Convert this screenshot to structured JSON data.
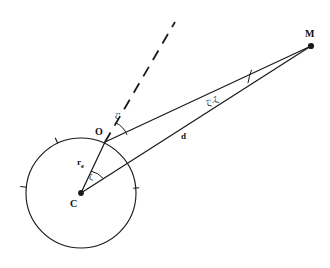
{
  "figure": {
    "background_color": "#ffffff",
    "stroke_color": "#1a1a1a",
    "width": 330,
    "height": 268
  },
  "points": [
    {
      "id": "C",
      "label": "C",
      "role": "sphere-center",
      "x": 81,
      "y": 193,
      "marker": "filled-dot",
      "label_x": 70,
      "label_y": 199
    },
    {
      "id": "O",
      "label": "O",
      "role": "observer-on-surface",
      "x": 105,
      "y": 142,
      "marker": "none",
      "label_x": 95,
      "label_y": 127
    },
    {
      "id": "M",
      "label": "M",
      "role": "distant-object",
      "x": 311,
      "y": 46,
      "marker": "filled-dot",
      "label_x": 305,
      "label_y": 29
    }
  ],
  "circle": {
    "name": "earth-sphere",
    "center_x": 81,
    "center_y": 193,
    "radius": 55,
    "tick_angles_deg": [
      5,
      115,
      186
    ],
    "tick_length": 6
  },
  "segments": [
    {
      "id": "CO",
      "name": "radius-segment",
      "from": "C",
      "to": "O",
      "style": "solid",
      "label": "r",
      "label_subscript": "e",
      "label_x": 77,
      "label_y": 158
    },
    {
      "id": "CM",
      "name": "distance-segment",
      "from": "C",
      "to": "M",
      "style": "solid",
      "label": "d",
      "label_subscript": "",
      "label_x": 181,
      "label_y": 132
    },
    {
      "id": "OM",
      "name": "line-of-sight-segment",
      "from": "O",
      "to": "M",
      "style": "solid",
      "label": "",
      "label_subscript": "",
      "label_x": 0,
      "label_y": 0
    }
  ],
  "zenith_ray": {
    "name": "zenith-direction",
    "from_x": 105,
    "from_y": 142,
    "to_x": 175,
    "to_y": 22,
    "style": "dashed"
  },
  "angles": [
    {
      "id": "zeta-prime",
      "name": "angle-zeta-prime-at-O",
      "label": "ζ'",
      "vertex": "O",
      "label_x": 115,
      "label_y": 112,
      "arc_radius": 19,
      "start_deg": 25,
      "end_deg": 60,
      "rotated": false
    },
    {
      "id": "zeta",
      "name": "angle-zeta-at-C",
      "label": "ζ",
      "vertex": "C",
      "label_x": 89,
      "label_y": 173,
      "arc_radius": 22,
      "start_deg": 25,
      "end_deg": 65,
      "rotated": false
    },
    {
      "id": "zeta-prime-minus-zeta",
      "name": "angle-zeta-prime-minus-zeta-at-M",
      "label": "ζ'-ζ",
      "vertex": "M",
      "label_x": 207,
      "label_y": 100,
      "arc_radius": 70,
      "start_deg": 0,
      "end_deg": 0,
      "rotated": true
    }
  ]
}
